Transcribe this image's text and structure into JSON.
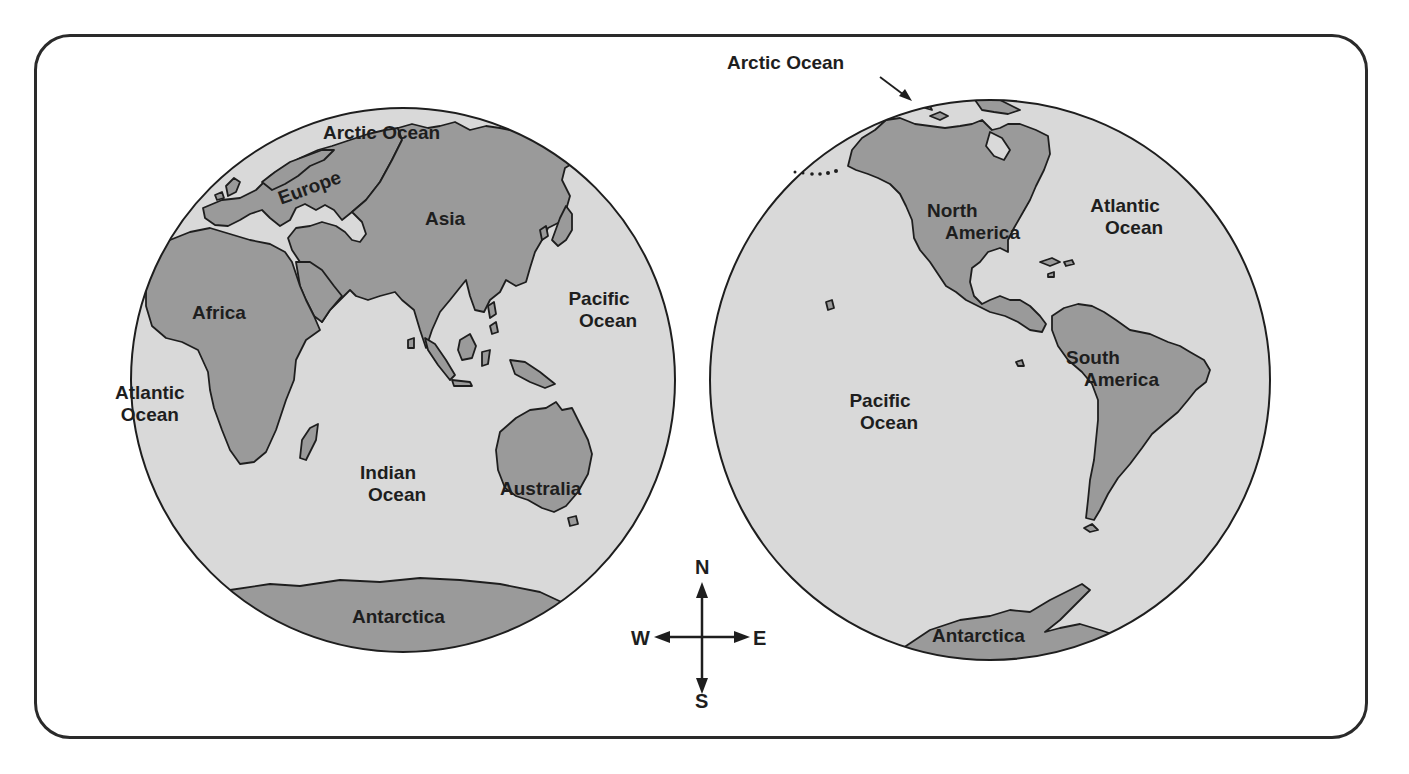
{
  "colors": {
    "ocean": "#d9d9d9",
    "land": "#9a9a9a",
    "outline": "#1e1e1e",
    "frame": "#2a2a2a",
    "background": "#ffffff"
  },
  "eastern_hemisphere": {
    "labels": {
      "arctic_ocean": "Arctic Ocean",
      "europe": "Europe",
      "asia": "Asia",
      "africa": "Africa",
      "pacific_ocean_line1": "Pacific",
      "pacific_ocean_line2": "Ocean",
      "atlantic_ocean_line1": "Atlantic",
      "atlantic_ocean_line2": "Ocean",
      "indian_ocean_line1": "Indian",
      "indian_ocean_line2": "Ocean",
      "australia": "Australia",
      "antarctica": "Antarctica"
    }
  },
  "western_hemisphere": {
    "labels": {
      "arctic_ocean": "Arctic Ocean",
      "north_america_line1": "North",
      "north_america_line2": "America",
      "atlantic_ocean_line1": "Atlantic",
      "atlantic_ocean_line2": "Ocean",
      "south_america_line1": "South",
      "south_america_line2": "America",
      "pacific_ocean_line1": "Pacific",
      "pacific_ocean_line2": "Ocean",
      "antarctica": "Antarctica"
    }
  },
  "compass": {
    "north": "N",
    "south": "S",
    "east": "E",
    "west": "W"
  }
}
